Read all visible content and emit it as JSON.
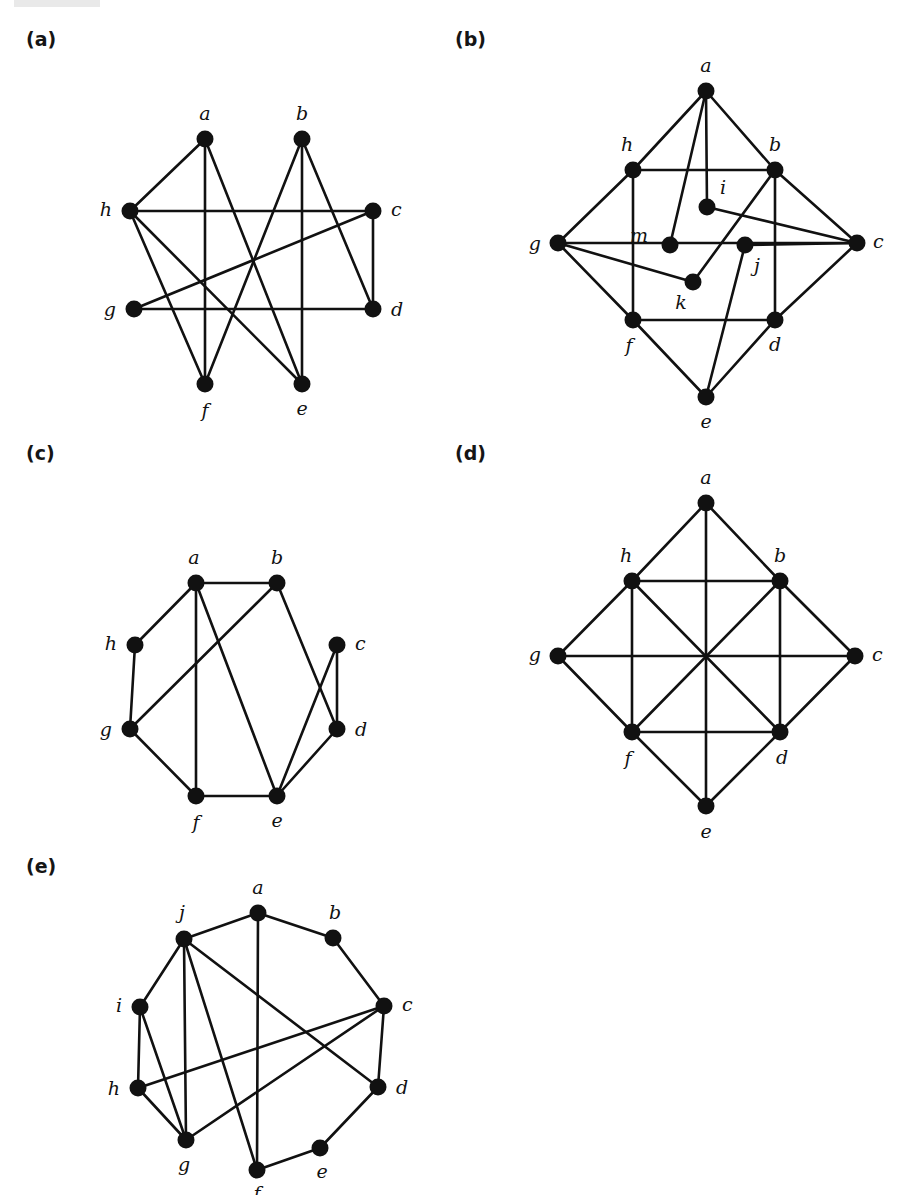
{
  "figure": {
    "title": "",
    "background": "#ffffff",
    "ink_color": "#111111",
    "panels": [
      {
        "id": "a",
        "label": "(a)",
        "label_x": 26,
        "label_y": 28,
        "origin_x": 0,
        "origin_y": 0,
        "vertices": [
          {
            "id": "a",
            "x": 205,
            "y": 139,
            "label": "a",
            "label_dx": 0,
            "label_dy": -24,
            "anchor": "middle"
          },
          {
            "id": "b",
            "x": 302,
            "y": 139,
            "label": "b",
            "label_dx": 0,
            "label_dy": -24,
            "anchor": "middle"
          },
          {
            "id": "c",
            "x": 373,
            "y": 211,
            "label": "c",
            "label_dx": 18,
            "label_dy": 0,
            "anchor": "start"
          },
          {
            "id": "d",
            "x": 373,
            "y": 309,
            "label": "d",
            "label_dx": 18,
            "label_dy": 2,
            "anchor": "start"
          },
          {
            "id": "e",
            "x": 302,
            "y": 384,
            "label": "e",
            "label_dx": 0,
            "label_dy": 26,
            "anchor": "middle"
          },
          {
            "id": "f",
            "x": 205,
            "y": 384,
            "label": "f",
            "label_dx": 0,
            "label_dy": 28,
            "anchor": "middle"
          },
          {
            "id": "g",
            "x": 134,
            "y": 309,
            "label": "g",
            "label_dx": -18,
            "label_dy": 2,
            "anchor": "end"
          },
          {
            "id": "h",
            "x": 130,
            "y": 211,
            "label": "h",
            "label_dx": -18,
            "label_dy": 0,
            "anchor": "end"
          }
        ],
        "edges": [
          [
            "a",
            "h"
          ],
          [
            "a",
            "f"
          ],
          [
            "a",
            "e"
          ],
          [
            "b",
            "f"
          ],
          [
            "b",
            "e"
          ],
          [
            "b",
            "d"
          ],
          [
            "h",
            "c"
          ],
          [
            "h",
            "f"
          ],
          [
            "h",
            "e"
          ],
          [
            "g",
            "c"
          ],
          [
            "g",
            "d"
          ],
          [
            "c",
            "d"
          ]
        ]
      },
      {
        "id": "b",
        "label": "(b)",
        "label_x": 455,
        "label_y": 28,
        "origin_x": 0,
        "origin_y": 0,
        "vertices": [
          {
            "id": "a",
            "x": 706,
            "y": 91,
            "label": "a",
            "label_dx": 0,
            "label_dy": -24,
            "anchor": "middle"
          },
          {
            "id": "b",
            "x": 775,
            "y": 170,
            "label": "b",
            "label_dx": 0,
            "label_dy": -24,
            "anchor": "middle"
          },
          {
            "id": "c",
            "x": 857,
            "y": 243,
            "label": "c",
            "label_dx": 16,
            "label_dy": 0,
            "anchor": "start"
          },
          {
            "id": "d",
            "x": 775,
            "y": 320,
            "label": "d",
            "label_dx": 0,
            "label_dy": 26,
            "anchor": "middle"
          },
          {
            "id": "e",
            "x": 706,
            "y": 397,
            "label": "e",
            "label_dx": 0,
            "label_dy": 26,
            "anchor": "middle"
          },
          {
            "id": "f",
            "x": 633,
            "y": 320,
            "label": "f",
            "label_dx": -4,
            "label_dy": 27,
            "anchor": "middle"
          },
          {
            "id": "g",
            "x": 558,
            "y": 243,
            "label": "g",
            "label_dx": -17,
            "label_dy": 2,
            "anchor": "end"
          },
          {
            "id": "h",
            "x": 633,
            "y": 170,
            "label": "h",
            "label_dx": -6,
            "label_dy": -24,
            "anchor": "middle"
          },
          {
            "id": "i",
            "x": 707,
            "y": 207,
            "label": "i",
            "label_dx": 13,
            "label_dy": -18,
            "anchor": "start"
          },
          {
            "id": "j",
            "x": 745,
            "y": 245,
            "label": "j",
            "label_dx": 12,
            "label_dy": 22,
            "anchor": "middle"
          },
          {
            "id": "k",
            "x": 693,
            "y": 282,
            "label": "k",
            "label_dx": -12,
            "label_dy": 22,
            "anchor": "middle"
          },
          {
            "id": "m",
            "x": 670,
            "y": 245,
            "label": "m",
            "label_dx": -22,
            "label_dy": -8,
            "anchor": "end"
          }
        ],
        "edges": [
          [
            "a",
            "h"
          ],
          [
            "a",
            "b"
          ],
          [
            "a",
            "m"
          ],
          [
            "a",
            "i"
          ],
          [
            "h",
            "b"
          ],
          [
            "h",
            "g"
          ],
          [
            "h",
            "f"
          ],
          [
            "b",
            "c"
          ],
          [
            "b",
            "d"
          ],
          [
            "b",
            "k"
          ],
          [
            "g",
            "c"
          ],
          [
            "g",
            "f"
          ],
          [
            "g",
            "k"
          ],
          [
            "c",
            "d"
          ],
          [
            "c",
            "i"
          ],
          [
            "c",
            "j"
          ],
          [
            "f",
            "d"
          ],
          [
            "f",
            "e"
          ],
          [
            "d",
            "e"
          ],
          [
            "e",
            "j"
          ]
        ]
      },
      {
        "id": "c",
        "label": "(c)",
        "label_x": 26,
        "label_y": 442,
        "origin_x": 0,
        "origin_y": 0,
        "vertices": [
          {
            "id": "a",
            "x": 196,
            "y": 583,
            "label": "a",
            "label_dx": -2,
            "label_dy": -24,
            "anchor": "middle"
          },
          {
            "id": "b",
            "x": 277,
            "y": 583,
            "label": "b",
            "label_dx": 0,
            "label_dy": -24,
            "anchor": "middle"
          },
          {
            "id": "c",
            "x": 337,
            "y": 645,
            "label": "c",
            "label_dx": 18,
            "label_dy": 0,
            "anchor": "start"
          },
          {
            "id": "d",
            "x": 337,
            "y": 729,
            "label": "d",
            "label_dx": 18,
            "label_dy": 2,
            "anchor": "start"
          },
          {
            "id": "e",
            "x": 277,
            "y": 796,
            "label": "e",
            "label_dx": 0,
            "label_dy": 26,
            "anchor": "middle"
          },
          {
            "id": "f",
            "x": 196,
            "y": 796,
            "label": "f",
            "label_dx": 0,
            "label_dy": 28,
            "anchor": "middle"
          },
          {
            "id": "g",
            "x": 130,
            "y": 729,
            "label": "g",
            "label_dx": -18,
            "label_dy": 2,
            "anchor": "end"
          },
          {
            "id": "h",
            "x": 135,
            "y": 645,
            "label": "h",
            "label_dx": -18,
            "label_dy": 0,
            "anchor": "end"
          }
        ],
        "edges": [
          [
            "a",
            "b"
          ],
          [
            "a",
            "h"
          ],
          [
            "a",
            "f"
          ],
          [
            "a",
            "e"
          ],
          [
            "b",
            "g"
          ],
          [
            "b",
            "d"
          ],
          [
            "h",
            "g"
          ],
          [
            "g",
            "f"
          ],
          [
            "f",
            "e"
          ],
          [
            "e",
            "c"
          ],
          [
            "e",
            "d"
          ],
          [
            "c",
            "d"
          ]
        ]
      },
      {
        "id": "d",
        "label": "(d)",
        "label_x": 455,
        "label_y": 442,
        "origin_x": 0,
        "origin_y": 0,
        "vertices": [
          {
            "id": "a",
            "x": 706,
            "y": 503,
            "label": "a",
            "label_dx": 0,
            "label_dy": -24,
            "anchor": "middle"
          },
          {
            "id": "b",
            "x": 780,
            "y": 581,
            "label": "b",
            "label_dx": 0,
            "label_dy": -24,
            "anchor": "middle"
          },
          {
            "id": "c",
            "x": 855,
            "y": 656,
            "label": "c",
            "label_dx": 17,
            "label_dy": 0,
            "anchor": "start"
          },
          {
            "id": "d",
            "x": 780,
            "y": 732,
            "label": "d",
            "label_dx": 2,
            "label_dy": 27,
            "anchor": "middle"
          },
          {
            "id": "e",
            "x": 706,
            "y": 806,
            "label": "e",
            "label_dx": 0,
            "label_dy": 27,
            "anchor": "middle"
          },
          {
            "id": "f",
            "x": 632,
            "y": 732,
            "label": "f",
            "label_dx": -4,
            "label_dy": 28,
            "anchor": "middle"
          },
          {
            "id": "g",
            "x": 558,
            "y": 656,
            "label": "g",
            "label_dx": -17,
            "label_dy": 0,
            "anchor": "end"
          },
          {
            "id": "h",
            "x": 632,
            "y": 581,
            "label": "h",
            "label_dx": -6,
            "label_dy": -24,
            "anchor": "middle"
          }
        ],
        "edges": [
          [
            "a",
            "h"
          ],
          [
            "a",
            "b"
          ],
          [
            "a",
            "e"
          ],
          [
            "h",
            "b"
          ],
          [
            "h",
            "g"
          ],
          [
            "h",
            "f"
          ],
          [
            "h",
            "d"
          ],
          [
            "b",
            "c"
          ],
          [
            "b",
            "d"
          ],
          [
            "b",
            "f"
          ],
          [
            "g",
            "c"
          ],
          [
            "g",
            "f"
          ],
          [
            "c",
            "d"
          ],
          [
            "f",
            "d"
          ],
          [
            "f",
            "e"
          ],
          [
            "d",
            "e"
          ]
        ]
      },
      {
        "id": "e",
        "label": "(e)",
        "label_x": 26,
        "label_y": 855,
        "origin_x": 0,
        "origin_y": 0,
        "vertices": [
          {
            "id": "a",
            "x": 258,
            "y": 913,
            "label": "a",
            "label_dx": 0,
            "label_dy": -24,
            "anchor": "middle"
          },
          {
            "id": "b",
            "x": 333,
            "y": 938,
            "label": "b",
            "label_dx": 2,
            "label_dy": -24,
            "anchor": "middle"
          },
          {
            "id": "c",
            "x": 384,
            "y": 1006,
            "label": "c",
            "label_dx": 18,
            "label_dy": 0,
            "anchor": "start"
          },
          {
            "id": "d",
            "x": 378,
            "y": 1087,
            "label": "d",
            "label_dx": 18,
            "label_dy": 2,
            "anchor": "start"
          },
          {
            "id": "e",
            "x": 320,
            "y": 1148,
            "label": "e",
            "label_dx": 2,
            "label_dy": 25,
            "anchor": "middle"
          },
          {
            "id": "f",
            "x": 257,
            "y": 1170,
            "label": "f",
            "label_dx": 0,
            "label_dy": 25,
            "anchor": "middle"
          },
          {
            "id": "g",
            "x": 186,
            "y": 1140,
            "label": "g",
            "label_dx": -2,
            "label_dy": 26,
            "anchor": "middle"
          },
          {
            "id": "h",
            "x": 138,
            "y": 1088,
            "label": "h",
            "label_dx": -18,
            "label_dy": 2,
            "anchor": "end"
          },
          {
            "id": "i",
            "x": 140,
            "y": 1007,
            "label": "i",
            "label_dx": -18,
            "label_dy": 0,
            "anchor": "end"
          },
          {
            "id": "j",
            "x": 184,
            "y": 939,
            "label": "j",
            "label_dx": -2,
            "label_dy": -25,
            "anchor": "middle"
          }
        ],
        "edges": [
          [
            "a",
            "b"
          ],
          [
            "a",
            "j"
          ],
          [
            "a",
            "f"
          ],
          [
            "b",
            "c"
          ],
          [
            "c",
            "d"
          ],
          [
            "c",
            "h"
          ],
          [
            "c",
            "g"
          ],
          [
            "d",
            "e"
          ],
          [
            "d",
            "j"
          ],
          [
            "e",
            "f"
          ],
          [
            "f",
            "j"
          ],
          [
            "g",
            "h"
          ],
          [
            "g",
            "i"
          ],
          [
            "g",
            "j"
          ],
          [
            "h",
            "i"
          ],
          [
            "i",
            "j"
          ]
        ]
      }
    ]
  }
}
